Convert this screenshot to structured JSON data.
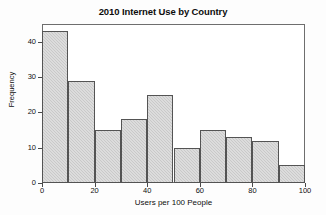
{
  "chart_data": {
    "type": "bar",
    "title": "2010 Internet Use by Country",
    "xlabel": "Users per 100 People",
    "ylabel": "Frequency",
    "categories": [
      "0-10",
      "10-20",
      "20-30",
      "30-40",
      "40-50",
      "50-60",
      "60-70",
      "70-80",
      "80-90",
      "90-100"
    ],
    "bin_edges": [
      0,
      10,
      20,
      30,
      40,
      50,
      60,
      70,
      80,
      90,
      100
    ],
    "values": [
      43,
      29,
      15,
      18,
      25,
      10,
      15,
      13,
      12,
      5
    ],
    "xlim": [
      0,
      100
    ],
    "ylim": [
      0,
      45
    ],
    "xticks": [
      0,
      20,
      40,
      60,
      80,
      100
    ],
    "yticks": [
      0,
      10,
      20,
      30,
      40
    ],
    "xtick_labels": [
      "0",
      "20",
      "40",
      "60",
      "80",
      "100"
    ],
    "ytick_labels": [
      "0",
      "10",
      "20",
      "30",
      "40"
    ],
    "grid": false,
    "legend": null,
    "bar_color": "#c9c9c9",
    "bar_edge_color": "#545454",
    "frame_color": "#6e6e6e"
  }
}
